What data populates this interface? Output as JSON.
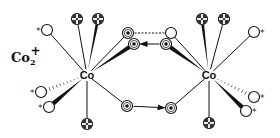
{
  "diagram": {
    "title_label": "Co",
    "title_subscript": "2",
    "title_superscript": "+",
    "metal_label": "Co",
    "star_marker": "*",
    "colors": {
      "ink": "#111111",
      "background": "#ffffff"
    },
    "metals": [
      {
        "id": "co-left",
        "label": "Co",
        "x": 87,
        "y": 75
      },
      {
        "id": "co-right",
        "label": "Co",
        "x": 209,
        "y": 75
      }
    ],
    "legend_of_atom_types": {
      "open": "open circle (ligand, starred = labeled)",
      "cross": "circle with dark cross/dots",
      "ring": "circle with central dot (bridging)"
    },
    "atoms": [
      {
        "id": "l-star-top",
        "type": "open",
        "x": 47,
        "y": 30,
        "star": "left",
        "metal": "co-left",
        "bond": "thin"
      },
      {
        "id": "l-cross-1",
        "type": "cross",
        "x": 77,
        "y": 19,
        "metal": "co-left",
        "bond": "thin"
      },
      {
        "id": "l-cross-2",
        "type": "cross",
        "x": 98,
        "y": 19,
        "metal": "co-left",
        "bond": "bold"
      },
      {
        "id": "l-star-b1",
        "type": "open",
        "x": 41,
        "y": 92,
        "star": "left",
        "metal": "co-left",
        "bond": "hash"
      },
      {
        "id": "l-star-b2",
        "type": "open",
        "x": 49,
        "y": 107,
        "star": "left",
        "metal": "co-left",
        "bond": "wedge"
      },
      {
        "id": "l-cross-bottom",
        "type": "cross",
        "x": 87,
        "y": 124,
        "metal": "co-left",
        "bond": "thin"
      },
      {
        "id": "bridge-tl",
        "type": "ring",
        "x": 128,
        "y": 33,
        "metal": "co-left",
        "bond": "thin"
      },
      {
        "id": "bridge-tl2",
        "type": "ring",
        "x": 134,
        "y": 44,
        "metal": "co-left",
        "bond": "wedge"
      },
      {
        "id": "bridge-bl",
        "type": "ring",
        "x": 127,
        "y": 106,
        "metal": "co-left",
        "bond": "thin"
      },
      {
        "id": "bridge-tr",
        "type": "open",
        "x": 171,
        "y": 33,
        "metal": "co-right",
        "bond": "thin"
      },
      {
        "id": "bridge-tr2",
        "type": "ring",
        "x": 166,
        "y": 44,
        "metal": "co-right",
        "bond": "wedge"
      },
      {
        "id": "bridge-br",
        "type": "ring",
        "x": 171,
        "y": 108,
        "metal": "co-right",
        "bond": "thin"
      },
      {
        "id": "r-cross-1",
        "type": "cross",
        "x": 202,
        "y": 19,
        "metal": "co-right",
        "bond": "bold"
      },
      {
        "id": "r-cross-2",
        "type": "cross",
        "x": 224,
        "y": 19,
        "metal": "co-right",
        "bond": "thin"
      },
      {
        "id": "r-star-top",
        "type": "open",
        "x": 254,
        "y": 32,
        "star": "right",
        "metal": "co-right",
        "bond": "thin"
      },
      {
        "id": "r-star-b1",
        "type": "open",
        "x": 254,
        "y": 97,
        "star": "right",
        "metal": "co-right",
        "bond": "hash"
      },
      {
        "id": "r-star-b2",
        "type": "open",
        "x": 246,
        "y": 111,
        "star": "right",
        "metal": "co-right",
        "bond": "wedge"
      },
      {
        "id": "r-cross-bottom",
        "type": "cross",
        "x": 209,
        "y": 123,
        "metal": "co-right",
        "bond": "thin"
      }
    ],
    "links": [
      {
        "from": "bridge-tl",
        "to": "bridge-tr",
        "style": "dashed"
      },
      {
        "from": "bridge-tr2",
        "to": "bridge-tl2",
        "style": "arrow"
      },
      {
        "from": "bridge-bl",
        "to": "bridge-br",
        "style": "arrow"
      }
    ]
  }
}
